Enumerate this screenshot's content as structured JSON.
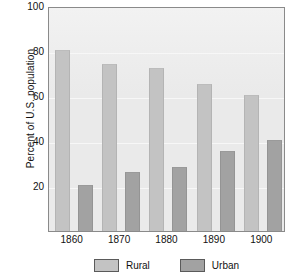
{
  "chart_data": {
    "type": "bar",
    "title": "",
    "subtitle": "",
    "xlabel": "",
    "ylabel": "Percent of U.S. population",
    "categories": [
      "1860",
      "1870",
      "1880",
      "1890",
      "1900"
    ],
    "series": [
      {
        "name": "Rural",
        "color": "#c3c3c3",
        "values": [
          80,
          74,
          72,
          65,
          60
        ]
      },
      {
        "name": "Urban",
        "color": "#a2a2a2",
        "values": [
          20,
          26,
          28,
          35,
          40
        ]
      }
    ],
    "ylim": [
      0,
      100
    ],
    "yticks": [
      20,
      40,
      60,
      80,
      100
    ],
    "ytick_labels": [
      "20",
      "40",
      "60",
      "80",
      "100"
    ],
    "grid": true,
    "legend_position": "bottom",
    "plot_background": "#eaeaea",
    "axis_color": "#8a8a8a"
  },
  "legend": {
    "items": [
      {
        "label": "Rural",
        "color": "#c3c3c3"
      },
      {
        "label": "Urban",
        "color": "#a2a2a2"
      }
    ]
  }
}
